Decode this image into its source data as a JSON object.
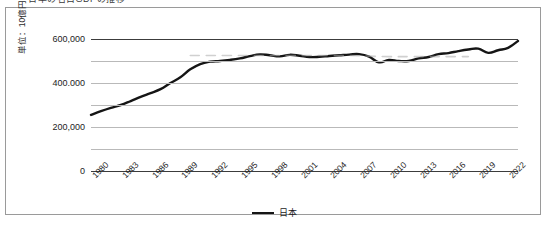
{
  "caption": {
    "text": "日本の名目GDPの推移"
  },
  "chart_data": {
    "type": "line",
    "title": "",
    "xlabel": "",
    "ylabel": "単位：10億円",
    "ylim": [
      0,
      600000
    ],
    "ytick_values": [
      0,
      100000,
      200000,
      300000,
      400000,
      500000,
      600000
    ],
    "ytick_labels": [
      "0",
      "",
      "200,000",
      "",
      "400.000",
      "",
      "600,000"
    ],
    "xlim": [
      1980,
      2023
    ],
    "xtick_labels": [
      "1980",
      "1983",
      "1986",
      "1989",
      "1992",
      "1995",
      "1998",
      "2001",
      "2004",
      "2007",
      "2010",
      "2013",
      "2016",
      "2019",
      "2022"
    ],
    "grid": true,
    "legend_position": "bottom",
    "series": [
      {
        "name": "日本",
        "color": "#151515",
        "style": "solid",
        "x": [
          1980,
          1981,
          1982,
          1983,
          1984,
          1985,
          1986,
          1987,
          1988,
          1989,
          1990,
          1991,
          1992,
          1993,
          1994,
          1995,
          1996,
          1997,
          1998,
          1999,
          2000,
          2001,
          2002,
          2003,
          2004,
          2005,
          2006,
          2007,
          2008,
          2009,
          2010,
          2011,
          2012,
          2013,
          2014,
          2015,
          2016,
          2017,
          2018,
          2019,
          2020,
          2021,
          2022,
          2023
        ],
        "values": [
          255000,
          272000,
          287000,
          300000,
          318000,
          337000,
          354000,
          372000,
          400000,
          426000,
          462000,
          486000,
          497000,
          500000,
          505000,
          512000,
          522000,
          530000,
          526000,
          521000,
          528000,
          524000,
          518000,
          519000,
          523000,
          526000,
          529000,
          531000,
          520000,
          494000,
          505000,
          500000,
          500000,
          512000,
          518000,
          531000,
          536000,
          545000,
          552000,
          556000,
          537000,
          549000,
          560000,
          591000
        ]
      },
      {
        "name": "",
        "color": "#a9a9a9",
        "style": "dashed",
        "x": [
          1990,
          1992,
          1994,
          1996,
          1998,
          2000,
          2002,
          2004,
          2006,
          2008,
          2010,
          2012,
          2014,
          2016,
          2018
        ],
        "values": [
          525000,
          525000,
          525000,
          525000,
          525000,
          525000,
          525000,
          525000,
          525000,
          522000,
          520000,
          520000,
          520000,
          520000,
          520000
        ]
      }
    ]
  },
  "legend": {
    "entries": [
      {
        "label": "日本",
        "color": "#151515"
      }
    ]
  }
}
